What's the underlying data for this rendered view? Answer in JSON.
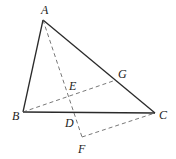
{
  "figure": {
    "type": "geometry-diagram",
    "points": {
      "A": {
        "label": "A"
      },
      "B": {
        "label": "B"
      },
      "C": {
        "label": "C"
      },
      "D": {
        "label": "D"
      },
      "E": {
        "label": "E"
      },
      "F": {
        "label": "F"
      },
      "G": {
        "label": "G"
      }
    },
    "solid_segments": [
      [
        "A",
        "B"
      ],
      [
        "B",
        "C"
      ],
      [
        "A",
        "C"
      ]
    ],
    "dashed_segments": [
      [
        "A",
        "F"
      ],
      [
        "B",
        "G"
      ],
      [
        "F",
        "C"
      ]
    ]
  }
}
